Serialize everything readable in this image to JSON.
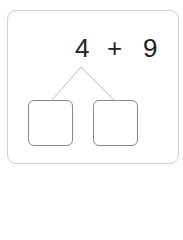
{
  "problem": {
    "left_operand": "4",
    "operator": "+",
    "right_operand": "9"
  },
  "answer_boxes": [
    {
      "value": ""
    },
    {
      "value": ""
    }
  ]
}
